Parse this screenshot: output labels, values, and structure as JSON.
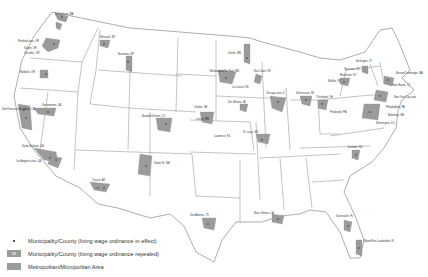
{
  "legend": {
    "items": [
      {
        "symbol": "dot",
        "label": "Municipality/County (living wage ordinance in effect)"
      },
      {
        "symbol": "box-marked",
        "label": "Municipality/County (living wage ordinance repealed)"
      },
      {
        "symbol": "box",
        "label": "Metropolitan/Micropolitan Area"
      }
    ]
  },
  "colors": {
    "metro_fill": "#9b9b9b",
    "state_line": "#9a9a9a",
    "background": "#ffffff"
  },
  "map": {
    "labels": [
      {
        "text": "Bellingham, WA",
        "x": 55,
        "y": 15
      },
      {
        "text": "Portland area, OR",
        "x": 20,
        "y": 40
      },
      {
        "text": "Salem, OR",
        "x": 24,
        "y": 48
      },
      {
        "text": "Corvallis, OR",
        "x": 24,
        "y": 53
      },
      {
        "text": "Medford, OR",
        "x": 20,
        "y": 73
      },
      {
        "text": "San Francisco Bay Area, CA",
        "x": 8,
        "y": 110
      },
      {
        "text": "Sacramento, CA",
        "x": 42,
        "y": 110
      },
      {
        "text": "Santa Barbara, CA",
        "x": 24,
        "y": 148
      },
      {
        "text": "Los Angeles area, CA",
        "x": 20,
        "y": 158
      },
      {
        "text": "Missoula, MT",
        "x": 102,
        "y": 39
      },
      {
        "text": "Bozeman, MT",
        "x": 118,
        "y": 54
      },
      {
        "text": "Boulder/Denver, CO",
        "x": 142,
        "y": 118
      },
      {
        "text": "Santa Fe, NM",
        "x": 152,
        "y": 162
      },
      {
        "text": "Tucson, AZ",
        "x": 92,
        "y": 182
      },
      {
        "text": "Duluth, MN",
        "x": 228,
        "y": 53
      },
      {
        "text": "Minneapolis/St. Paul, MN",
        "x": 227,
        "y": 74
      },
      {
        "text": "Eau Claire, WI",
        "x": 255,
        "y": 73
      },
      {
        "text": "La Crosse, WI",
        "x": 232,
        "y": 85
      },
      {
        "text": "Omaha, NE",
        "x": 196,
        "y": 108
      },
      {
        "text": "Lincoln, NE",
        "x": 200,
        "y": 118
      },
      {
        "text": "Des Moines, IA",
        "x": 230,
        "y": 102
      },
      {
        "text": "St. Louis, MO",
        "x": 243,
        "y": 132
      },
      {
        "text": "Lawrence, KS",
        "x": 215,
        "y": 135
      },
      {
        "text": "Chicago area, IL",
        "x": 270,
        "y": 100
      },
      {
        "text": "Detroit area, MI",
        "x": 300,
        "y": 100
      },
      {
        "text": "Cleveland, OH",
        "x": 318,
        "y": 105
      },
      {
        "text": "Pittsburgh, PA",
        "x": 330,
        "y": 112
      },
      {
        "text": "Buffalo, NY",
        "x": 343,
        "y": 83
      },
      {
        "text": "Rochester, NY",
        "x": 346,
        "y": 78
      },
      {
        "text": "Syracuse, NY",
        "x": 357,
        "y": 72
      },
      {
        "text": "Burlington, VT",
        "x": 360,
        "y": 60
      },
      {
        "text": "Boston/Cambridge, MA",
        "x": 398,
        "y": 73
      },
      {
        "text": "New Haven, CT",
        "x": 390,
        "y": 84
      },
      {
        "text": "New York City area",
        "x": 395,
        "y": 98
      },
      {
        "text": "Philadelphia, PA",
        "x": 388,
        "y": 108
      },
      {
        "text": "Baltimore, MD",
        "x": 392,
        "y": 116
      },
      {
        "text": "Washington, DC",
        "x": 380,
        "y": 120
      },
      {
        "text": "Durham, NC",
        "x": 355,
        "y": 152
      },
      {
        "text": "San Antonio, TX",
        "x": 192,
        "y": 217
      },
      {
        "text": "New Orleans, LA",
        "x": 255,
        "y": 215
      },
      {
        "text": "Gainesville, FL",
        "x": 340,
        "y": 217
      },
      {
        "text": "Miami/Fort Lauderdale, FL",
        "x": 365,
        "y": 240
      }
    ]
  }
}
